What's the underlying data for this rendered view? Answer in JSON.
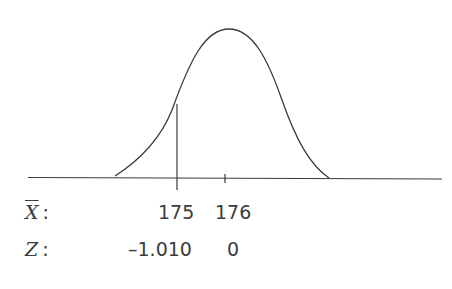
{
  "diagram": {
    "type": "normal-distribution-curve",
    "rows": [
      {
        "variable": "X",
        "variable_decoration": "overline",
        "colon": ":",
        "values": [
          "175",
          "176"
        ]
      },
      {
        "variable": "Z",
        "colon": ":",
        "values": [
          "–1.010",
          "0"
        ]
      }
    ],
    "marker_line_at": "175",
    "center_tick_at": "176",
    "colors": {
      "line": "#3a3a3a",
      "background": "#ffffff"
    }
  }
}
